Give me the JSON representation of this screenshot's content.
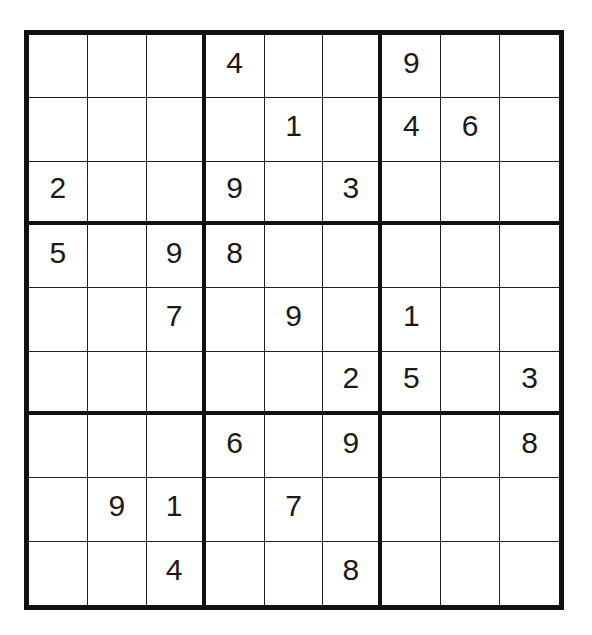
{
  "puzzle": {
    "type": "sudoku",
    "size": 9,
    "grid": [
      [
        "",
        "",
        "",
        "4",
        "",
        "",
        "9",
        "",
        ""
      ],
      [
        "",
        "",
        "",
        "",
        "1",
        "",
        "4",
        "6",
        ""
      ],
      [
        "2",
        "",
        "",
        "9",
        "",
        "3",
        "",
        "",
        ""
      ],
      [
        "5",
        "",
        "9",
        "8",
        "",
        "",
        "",
        "",
        ""
      ],
      [
        "",
        "",
        "7",
        "",
        "9",
        "",
        "1",
        "",
        ""
      ],
      [
        "",
        "",
        "",
        "",
        "",
        "2",
        "5",
        "",
        "3"
      ],
      [
        "",
        "",
        "",
        "6",
        "",
        "9",
        "",
        "",
        "8"
      ],
      [
        "",
        "9",
        "1",
        "",
        "7",
        "",
        "",
        "",
        ""
      ],
      [
        "",
        "",
        "4",
        "",
        "",
        "8",
        "",
        "",
        ""
      ]
    ]
  },
  "colors": {
    "grid_line": "#111111",
    "digit": "#1a1a1a",
    "background": "#ffffff"
  }
}
